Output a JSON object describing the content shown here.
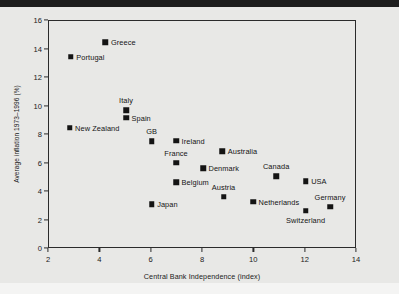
{
  "chart_data": {
    "type": "scatter",
    "title": "",
    "xlabel": "Central Bank Independence (index)",
    "ylabel": "Average inflation 1973–1996 (%)",
    "xlim": [
      2,
      14
    ],
    "ylim": [
      0,
      16
    ],
    "xticks": [
      "2",
      "4",
      "6",
      "8",
      "10",
      "12",
      "14"
    ],
    "yticks": [
      "0",
      "2",
      "4",
      "6",
      "8",
      "10",
      "12",
      "14",
      "16"
    ],
    "grid": false,
    "legend": "none",
    "points": [
      {
        "label": "Greece",
        "x": 4.2,
        "y": 14.5,
        "label_pos": "right"
      },
      {
        "label": "Portugal",
        "x": 2.85,
        "y": 13.5,
        "label_pos": "right"
      },
      {
        "label": "Italy",
        "x": 5.0,
        "y": 9.75,
        "label_pos": "above"
      },
      {
        "label": "Spain",
        "x": 5.0,
        "y": 9.2,
        "label_pos": "right"
      },
      {
        "label": "New Zealand",
        "x": 2.8,
        "y": 8.5,
        "label_pos": "right"
      },
      {
        "label": "GB",
        "x": 6.0,
        "y": 7.55,
        "label_pos": "above"
      },
      {
        "label": "Ireland",
        "x": 6.95,
        "y": 7.6,
        "label_pos": "right"
      },
      {
        "label": "Australia",
        "x": 8.75,
        "y": 6.85,
        "label_pos": "right"
      },
      {
        "label": "France",
        "x": 6.95,
        "y": 6.05,
        "label_pos": "above"
      },
      {
        "label": "Denmark",
        "x": 8.0,
        "y": 5.65,
        "label_pos": "right"
      },
      {
        "label": "Canada",
        "x": 10.85,
        "y": 5.1,
        "label_pos": "above"
      },
      {
        "label": "USA",
        "x": 12.0,
        "y": 4.75,
        "label_pos": "right"
      },
      {
        "label": "Belgium",
        "x": 6.95,
        "y": 4.7,
        "label_pos": "right"
      },
      {
        "label": "Austria",
        "x": 8.8,
        "y": 3.65,
        "label_pos": "above"
      },
      {
        "label": "Netherlands",
        "x": 9.95,
        "y": 3.3,
        "label_pos": "right"
      },
      {
        "label": "Germany",
        "x": 12.95,
        "y": 2.95,
        "label_pos": "above"
      },
      {
        "label": "Japan",
        "x": 6.0,
        "y": 3.15,
        "label_pos": "right"
      },
      {
        "label": "Switzerland",
        "x": 12.0,
        "y": 2.7,
        "label_pos": "below"
      }
    ]
  },
  "colors": {
    "background": "#e8e8e6",
    "marker": "#141414",
    "axis": "#2b2b2b",
    "text": "#1a1a1a"
  }
}
